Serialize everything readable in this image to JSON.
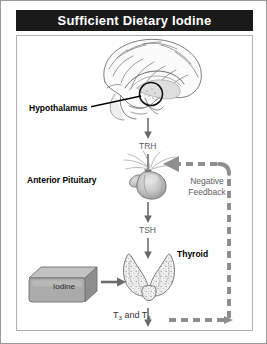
{
  "figure": {
    "title": "Sufficient Dietary Iodine",
    "alt": "Hypothalamic-pituitary-thyroid axis with sufficient dietary iodine"
  },
  "colors": {
    "title_bar_bg": "#1a1a1a",
    "title_text": "#ffffff",
    "outer_border": "#9a9a9a",
    "panel_border": "#b0b0b0",
    "arrow_solid": "#6b6b6b",
    "arrow_dashed": "#8f8f8f",
    "label_bold": "#000000",
    "label_gray": "#5d5d5d",
    "organ_fill": "#c9c9c9",
    "iodine_box_fill": "#a8a8a8",
    "background": "#ffffff"
  },
  "labels": {
    "hypothalamus": "Hypothalamus",
    "trh": "TRH",
    "anterior_pituitary": "Anterior Pituitary",
    "tsh": "TSH",
    "thyroid": "Thyroid",
    "iodine": "Iodine",
    "hormones_prefix": "T",
    "hormones_sub_one": "3",
    "hormones_mid": " and T",
    "hormones_sub_two": "4",
    "hormones_full": "T3 and T4",
    "negative_feedback_line1": "Negative",
    "negative_feedback_line2": "Feedback"
  },
  "icons": {
    "brain": "brain-sagittal-icon",
    "hypothalamus_circle": "hypothalamus-highlight-circle-icon",
    "pituitary": "pituitary-gland-icon",
    "thyroid": "thyroid-gland-icon",
    "iodine_box": "iodine-block-icon",
    "arrow_down_trh": "arrow-down-icon",
    "arrow_down_tsh": "arrow-down-icon",
    "arrow_right_iodine": "arrow-right-icon",
    "arrow_feedback": "arrow-left-dashed-icon"
  },
  "flow": {
    "steps": [
      {
        "id": "hypothalamus",
        "label": "Hypothalamus",
        "emits": "TRH"
      },
      {
        "id": "anterior-pituitary",
        "label": "Anterior Pituitary",
        "emits": "TSH"
      },
      {
        "id": "thyroid",
        "label": "Thyroid",
        "emits": "T3 and T4",
        "input": "Iodine"
      }
    ],
    "feedback": {
      "label": "Negative Feedback",
      "from": "T3 and T4",
      "to": "Anterior Pituitary",
      "style": "dashed"
    }
  }
}
